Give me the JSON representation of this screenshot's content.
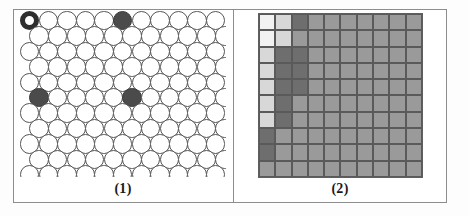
{
  "figure": {
    "title": "",
    "panels": [
      {
        "id": "panel-1",
        "caption": "(1)",
        "type": "circle-lattice",
        "description": "Close packed lattice of open circles with one ring-marked site and three filled sites",
        "columns": 11,
        "rows": 11,
        "colors": {
          "open_fill": "#ffffff",
          "open_stroke": "#555555",
          "filled": "#4b4b4b",
          "ring_stroke": "#2e2e2e"
        },
        "marked_sites": [
          {
            "row": 1,
            "col": 1,
            "state": "ring"
          },
          {
            "row": 1,
            "col": 6,
            "state": "filled"
          },
          {
            "row": 6,
            "col": 1,
            "state": "filled"
          },
          {
            "row": 6,
            "col": 6,
            "state": "filled"
          }
        ]
      },
      {
        "id": "panel-2",
        "caption": "(2)",
        "type": "shaded-grid",
        "description": "10 by 10 grid of cells shaded in four gray levels forming a corner gradient",
        "columns": 10,
        "rows": 10,
        "legend_levels": [
          "#f2f2f2",
          "#d8d8d8",
          "#9a9a9a",
          "#6e6e6e"
        ],
        "grid_line_color": "#5a5a5a"
      }
    ]
  },
  "chart_data": [
    {
      "type": "heatmap",
      "title": "(1)",
      "xlabel": "",
      "ylabel": "",
      "categories": [
        "c1",
        "c2",
        "c3",
        "c4",
        "c5",
        "c6",
        "c7",
        "c8",
        "c9",
        "c10",
        "c11"
      ],
      "legend": [
        "open site",
        "ring site",
        "filled site"
      ],
      "values": [
        [
          2,
          0,
          0,
          0,
          0,
          3,
          0,
          0,
          0,
          0,
          0
        ],
        [
          0,
          0,
          0,
          0,
          0,
          0,
          0,
          0,
          0,
          0,
          0
        ],
        [
          0,
          0,
          0,
          0,
          0,
          0,
          0,
          0,
          0,
          0,
          0
        ],
        [
          0,
          0,
          0,
          0,
          0,
          0,
          0,
          0,
          0,
          0,
          0
        ],
        [
          0,
          0,
          0,
          0,
          0,
          0,
          0,
          0,
          0,
          0,
          0
        ],
        [
          3,
          0,
          0,
          0,
          0,
          3,
          0,
          0,
          0,
          0,
          0
        ],
        [
          0,
          0,
          0,
          0,
          0,
          0,
          0,
          0,
          0,
          0,
          0
        ],
        [
          0,
          0,
          0,
          0,
          0,
          0,
          0,
          0,
          0,
          0,
          0
        ],
        [
          0,
          0,
          0,
          0,
          0,
          0,
          0,
          0,
          0,
          0,
          0
        ],
        [
          0,
          0,
          0,
          0,
          0,
          0,
          0,
          0,
          0,
          0,
          0
        ],
        [
          0,
          0,
          0,
          0,
          0,
          0,
          0,
          0,
          0,
          0,
          0
        ]
      ]
    },
    {
      "type": "heatmap",
      "title": "(2)",
      "xlabel": "",
      "ylabel": "",
      "grid": true,
      "legend": [],
      "colorscale": [
        "#f2f2f2",
        "#d8d8d8",
        "#9a9a9a",
        "#6e6e6e"
      ],
      "values": [
        [
          0,
          1,
          3,
          2,
          2,
          2,
          2,
          2,
          2,
          2
        ],
        [
          0,
          1,
          2,
          2,
          2,
          2,
          2,
          2,
          2,
          2
        ],
        [
          1,
          3,
          3,
          2,
          2,
          2,
          2,
          2,
          2,
          2
        ],
        [
          1,
          3,
          3,
          2,
          2,
          2,
          2,
          2,
          2,
          2
        ],
        [
          1,
          3,
          3,
          2,
          2,
          2,
          2,
          2,
          2,
          2
        ],
        [
          1,
          3,
          2,
          2,
          2,
          2,
          2,
          2,
          2,
          2
        ],
        [
          1,
          3,
          2,
          2,
          2,
          2,
          2,
          2,
          2,
          2
        ],
        [
          3,
          2,
          2,
          2,
          2,
          2,
          2,
          2,
          2,
          2
        ],
        [
          3,
          2,
          2,
          2,
          2,
          2,
          2,
          2,
          2,
          2
        ],
        [
          2,
          2,
          2,
          2,
          2,
          2,
          2,
          2,
          2,
          2
        ]
      ]
    }
  ]
}
